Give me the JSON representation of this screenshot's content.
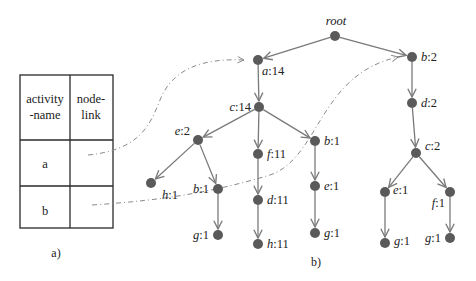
{
  "figure": {
    "panel_a": {
      "caption": "a)",
      "table": {
        "headers": [
          [
            "activity",
            "-name"
          ],
          [
            "node-",
            "link"
          ]
        ],
        "rows": [
          {
            "activity_name": "a",
            "node_link": ""
          },
          {
            "activity_name": "b",
            "node_link": ""
          }
        ]
      }
    },
    "panel_b": {
      "caption": "b)",
      "root_label": "root",
      "nodes": [
        {
          "id": "root",
          "item": "",
          "count": "",
          "x": 335,
          "y": 36
        },
        {
          "id": "n_a14",
          "item": "a",
          "count": "14",
          "x": 258,
          "y": 60
        },
        {
          "id": "n_b2",
          "item": "b",
          "count": "2",
          "x": 412,
          "y": 57
        },
        {
          "id": "n_c14",
          "item": "c",
          "count": "14",
          "x": 259,
          "y": 107
        },
        {
          "id": "n_d2",
          "item": "d",
          "count": "2",
          "x": 412,
          "y": 103
        },
        {
          "id": "n_e2",
          "item": "e",
          "count": "2",
          "x": 198,
          "y": 140
        },
        {
          "id": "n_f11",
          "item": "f",
          "count": "11",
          "x": 258,
          "y": 154
        },
        {
          "id": "n_b1a",
          "item": "b",
          "count": "1",
          "x": 315,
          "y": 141
        },
        {
          "id": "n_c2",
          "item": "c",
          "count": "2",
          "x": 416,
          "y": 153
        },
        {
          "id": "n_h1",
          "item": "h",
          "count": "1",
          "x": 151,
          "y": 183
        },
        {
          "id": "n_b1b",
          "item": "b",
          "count": "1",
          "x": 218,
          "y": 189
        },
        {
          "id": "n_d11",
          "item": "d",
          "count": "11",
          "x": 258,
          "y": 200
        },
        {
          "id": "n_e1a",
          "item": "e",
          "count": "1",
          "x": 315,
          "y": 186
        },
        {
          "id": "n_e1b",
          "item": "e",
          "count": "1",
          "x": 385,
          "y": 192
        },
        {
          "id": "n_f1",
          "item": "f",
          "count": "1",
          "x": 450,
          "y": 192
        },
        {
          "id": "n_g1a",
          "item": "g",
          "count": "1",
          "x": 218,
          "y": 235
        },
        {
          "id": "n_h11",
          "item": "h",
          "count": "11",
          "x": 258,
          "y": 244
        },
        {
          "id": "n_g1b",
          "item": "g",
          "count": "1",
          "x": 315,
          "y": 233
        },
        {
          "id": "n_g1c",
          "item": "g",
          "count": "1",
          "x": 385,
          "y": 243
        },
        {
          "id": "n_g1d",
          "item": "g",
          "count": "1",
          "x": 450,
          "y": 238
        }
      ],
      "edges": [
        [
          "root",
          "n_a14"
        ],
        [
          "root",
          "n_b2"
        ],
        [
          "n_a14",
          "n_c14"
        ],
        [
          "n_b2",
          "n_d2"
        ],
        [
          "n_c14",
          "n_e2"
        ],
        [
          "n_c14",
          "n_f11"
        ],
        [
          "n_c14",
          "n_b1a"
        ],
        [
          "n_d2",
          "n_c2"
        ],
        [
          "n_e2",
          "n_h1"
        ],
        [
          "n_e2",
          "n_b1b"
        ],
        [
          "n_f11",
          "n_d11"
        ],
        [
          "n_b1a",
          "n_e1a"
        ],
        [
          "n_c2",
          "n_e1b"
        ],
        [
          "n_c2",
          "n_f1"
        ],
        [
          "n_b1b",
          "n_g1a"
        ],
        [
          "n_d11",
          "n_h11"
        ],
        [
          "n_e1a",
          "n_g1b"
        ],
        [
          "n_e1b",
          "n_g1c"
        ],
        [
          "n_f1",
          "n_g1d"
        ]
      ],
      "node_links": [
        {
          "from_row": "a",
          "to": "n_a14"
        },
        {
          "from_row": "b",
          "to": "n_b2"
        }
      ]
    },
    "colors": {
      "node": "#5a5a5a",
      "edge": "#7a7a7a",
      "link": "#8a8a8a",
      "table": "#2a2a2a",
      "text": "#1a1a1a"
    }
  }
}
